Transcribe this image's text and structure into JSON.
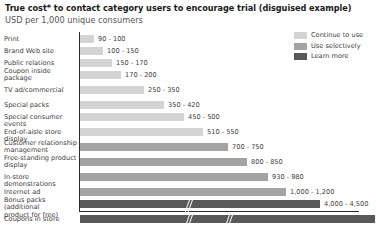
{
  "header": {
    "title": "True cost* to contact category users to encourage trial (disguised example)",
    "subtitle": "USD per 1,000 unique consumers"
  },
  "legend": {
    "position": "top-right",
    "items": [
      {
        "label": "Continue to use",
        "color": "#d4d4d4"
      },
      {
        "label": "Use selectively",
        "color": "#a3a3a3"
      },
      {
        "label": "Learn more",
        "color": "#595959"
      }
    ]
  },
  "chart_data": {
    "type": "bar",
    "orientation": "horizontal",
    "title": "True cost* to contact category users to encourage trial (disguised example)",
    "subtitle": "USD per 1,000 unique consumers",
    "xlabel": "",
    "ylabel": "",
    "grid": false,
    "axis_break": true,
    "legend_position": "top-right",
    "categories": [
      "Print",
      "Brand Web site",
      "Public relations",
      "Coupon inside package",
      "TV ad/commercial",
      "Special packs",
      "Special consumer events",
      "End-of-aisle store display",
      "Customer relationship management",
      "Free-standing product display",
      "In-store demonstrations",
      "Internet ad",
      "Bonus packs (additional product for free)",
      "Coupons in store"
    ],
    "value_labels": [
      "90 - 100",
      "100 - 150",
      "150 - 170",
      "170 - 200",
      "250 - 350",
      "350 - 420",
      "450 - 500",
      "510 - 550",
      "700 - 750",
      "800 - 850",
      "930 - 980",
      "1,000 - 1,200",
      "4,000 - 4,500",
      "10,000 - 12,000"
    ],
    "low": [
      90,
      100,
      150,
      170,
      250,
      350,
      450,
      510,
      700,
      800,
      930,
      1000,
      4000,
      10000
    ],
    "high": [
      100,
      150,
      170,
      200,
      350,
      420,
      500,
      550,
      750,
      850,
      980,
      1200,
      4500,
      12000
    ],
    "series_groups": [
      {
        "name": "Continue to use",
        "color": "#d4d4d4",
        "categories": [
          "Print",
          "Brand Web site",
          "Public relations",
          "Coupon inside package",
          "TV ad/commercial",
          "Special packs",
          "Special consumer events",
          "End-of-aisle store display"
        ]
      },
      {
        "name": "Use selectively",
        "color": "#a3a3a3",
        "categories": [
          "Customer relationship management",
          "Free-standing product display",
          "In-store demonstrations",
          "Internet ad"
        ]
      },
      {
        "name": "Learn more",
        "color": "#595959",
        "categories": [
          "Bonus packs (additional product for free)",
          "Coupons in store"
        ]
      }
    ]
  },
  "rows": [
    {
      "label": "Print",
      "label_lines": [
        "Print"
      ],
      "value": "90 - 100",
      "color": "#d4d4d4",
      "bar_px": 14,
      "breaks": []
    },
    {
      "label": "Brand Web site",
      "label_lines": [
        "Brand Web site"
      ],
      "value": "100 - 150",
      "color": "#d4d4d4",
      "bar_px": 23,
      "breaks": []
    },
    {
      "label": "Public relations",
      "label_lines": [
        "Public relations"
      ],
      "value": "150 - 170",
      "color": "#d4d4d4",
      "bar_px": 32,
      "breaks": []
    },
    {
      "label": "Coupon inside package",
      "label_lines": [
        "Coupon inside",
        "package"
      ],
      "value": "170 - 200",
      "color": "#d4d4d4",
      "bar_px": 41,
      "breaks": []
    },
    {
      "label": "TV ad/commercial",
      "label_lines": [
        "TV ad/commercial"
      ],
      "value": "250 - 350",
      "color": "#d4d4d4",
      "bar_px": 64,
      "breaks": []
    },
    {
      "label": "Special packs",
      "label_lines": [
        "Special packs"
      ],
      "value": "350 - 420",
      "color": "#d4d4d4",
      "bar_px": 84,
      "breaks": []
    },
    {
      "label": "Special consumer events",
      "label_lines": [
        "Special consumer events"
      ],
      "value": "450 - 500",
      "color": "#d4d4d4",
      "bar_px": 104,
      "breaks": []
    },
    {
      "label": "End-of-aisle store display",
      "label_lines": [
        "End-of-aisle store display"
      ],
      "value": "510 - 550",
      "color": "#d4d4d4",
      "bar_px": 123,
      "breaks": []
    },
    {
      "label": "Customer relationship management",
      "label_lines": [
        "Customer relationship",
        "management"
      ],
      "value": "700 - 750",
      "color": "#a3a3a3",
      "bar_px": 148,
      "breaks": []
    },
    {
      "label": "Free-standing product display",
      "label_lines": [
        "Free-standing product",
        "display"
      ],
      "value": "800 - 850",
      "color": "#a3a3a3",
      "bar_px": 167,
      "breaks": []
    },
    {
      "label": "In-store demonstrations",
      "label_lines": [
        "In-store demonstrations"
      ],
      "value": "930 - 980",
      "color": "#a3a3a3",
      "bar_px": 188,
      "breaks": []
    },
    {
      "label": "Internet ad",
      "label_lines": [
        "Internet ad"
      ],
      "value": "1,000 - 1,200",
      "color": "#a3a3a3",
      "bar_px": 206,
      "breaks": []
    },
    {
      "label": "Bonus packs (additional product for free)",
      "label_lines": [
        "Bonus packs (additional",
        "product for free)"
      ],
      "value": "4,000 - 4,500",
      "color": "#595959",
      "bar_px": 240,
      "breaks": [
        185
      ]
    },
    {
      "label": "Coupons in store",
      "label_lines": [
        "Coupons in store"
      ],
      "value": "10,000 - 12,000",
      "color": "#595959",
      "bar_px": 295,
      "breaks": [
        185,
        225
      ]
    }
  ],
  "row_tops": [
    3,
    15,
    27,
    39,
    54,
    69,
    81,
    96,
    111,
    126,
    141,
    156,
    168,
    183
  ],
  "colors": {
    "light_gray": "#d4d4d4",
    "medium_gray": "#a3a3a3",
    "dark_gray": "#595959",
    "axis": "#2b2b2b",
    "text": "#3d3d3d",
    "title": "#1a1a1a",
    "background": "#ffffff"
  }
}
